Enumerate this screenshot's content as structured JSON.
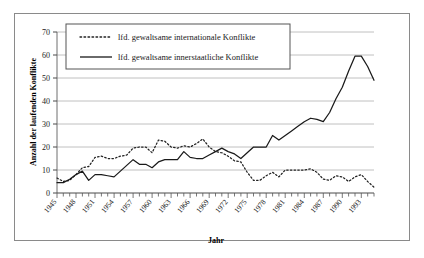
{
  "chart_data": {
    "type": "line",
    "title": "",
    "xlabel": "Jahr",
    "ylabel": "Anzahl der laufenden Konflikte",
    "xlim": [
      1945,
      1995
    ],
    "ylim": [
      0,
      70
    ],
    "ytick_labels": [
      "0",
      "10",
      "20",
      "30",
      "40",
      "50",
      "60",
      "70"
    ],
    "yticks": [
      0,
      10,
      20,
      30,
      40,
      50,
      60,
      70
    ],
    "xtick_labels": [
      "1945",
      "1948",
      "1951",
      "1954",
      "1957",
      "1960",
      "1963",
      "1966",
      "1969",
      "1972",
      "1975",
      "1978",
      "1981",
      "1984",
      "1987",
      "1990",
      "1993"
    ],
    "xticks": [
      1945,
      1948,
      1951,
      1954,
      1957,
      1960,
      1963,
      1966,
      1969,
      1972,
      1975,
      1978,
      1981,
      1984,
      1987,
      1990,
      1993
    ],
    "minor_xticks_every": 1,
    "grid": "horizontal",
    "legend_position": "top-center",
    "x": [
      1945,
      1946,
      1947,
      1948,
      1949,
      1950,
      1951,
      1952,
      1953,
      1954,
      1955,
      1956,
      1957,
      1958,
      1959,
      1960,
      1961,
      1962,
      1963,
      1964,
      1965,
      1966,
      1967,
      1968,
      1969,
      1970,
      1971,
      1972,
      1973,
      1974,
      1975,
      1976,
      1977,
      1978,
      1979,
      1980,
      1981,
      1982,
      1983,
      1984,
      1985,
      1986,
      1987,
      1988,
      1989,
      1990,
      1991,
      1992,
      1993,
      1994,
      1995
    ],
    "series": [
      {
        "name": "lfd. gewaltsame internationale Konflikte",
        "style": "dotted",
        "color": "#222222",
        "values": [
          6.5,
          5.0,
          5.5,
          8.0,
          11.0,
          11.5,
          15.5,
          16.0,
          15.0,
          15.0,
          16.0,
          16.5,
          19.5,
          20.0,
          20.0,
          17.5,
          23.0,
          22.5,
          20.0,
          19.5,
          20.5,
          20.0,
          21.5,
          23.5,
          20.0,
          18.0,
          17.5,
          16.0,
          14.0,
          13.5,
          9.0,
          5.5,
          5.5,
          7.5,
          9.0,
          7.0,
          10.0,
          10.0,
          10.0,
          10.0,
          10.5,
          9.0,
          6.0,
          5.5,
          7.5,
          7.0,
          5.0,
          7.0,
          8.0,
          5.0,
          2.5
        ]
      },
      {
        "name": "lfd. gewaltsame innerstaatliche Konflikte",
        "style": "solid",
        "color": "#1a1a1a",
        "values": [
          4.5,
          4.5,
          6.0,
          8.0,
          9.5,
          5.5,
          8.0,
          8.0,
          7.5,
          7.0,
          9.5,
          12.0,
          14.5,
          12.5,
          12.5,
          11.0,
          13.5,
          14.5,
          14.5,
          14.5,
          18.0,
          15.5,
          15.0,
          15.0,
          16.5,
          18.0,
          19.5,
          18.0,
          17.0,
          15.0,
          17.5,
          20.0,
          20.0,
          20.0,
          25.0,
          23.0,
          25.0,
          27.0,
          29.0,
          31.0,
          32.5,
          32.0,
          31.0,
          35.0,
          41.0,
          46.0,
          53.0,
          59.5,
          59.5,
          55.0,
          49.0
        ]
      }
    ]
  },
  "legend": {
    "items": [
      {
        "label": "lfd. gewaltsame internationale Konflikte",
        "style": "dotted"
      },
      {
        "label": "lfd. gewaltsame innerstaatliche Konflikte",
        "style": "solid"
      }
    ]
  },
  "axes": {
    "y_title": "Anzahl der laufenden Konflikte",
    "x_title": "Jahr"
  }
}
